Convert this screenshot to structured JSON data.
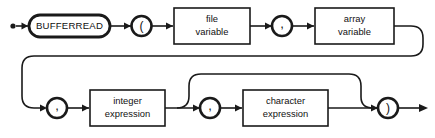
{
  "diagram": {
    "kind": "railroad-syntax-diagram",
    "statement": "BUFFERREAD",
    "start_marker": "start-dot",
    "end_marker": "arrow",
    "nodes": {
      "keyword": {
        "label": "BUFFERREAD",
        "shape": "stadium"
      },
      "open_paren": {
        "label": "(",
        "shape": "circle"
      },
      "file_variable": {
        "line1": "file",
        "line2": "variable",
        "shape": "rect"
      },
      "comma1": {
        "label": ",",
        "shape": "circle"
      },
      "array_variable": {
        "line1": "array",
        "line2": "variable",
        "shape": "rect"
      },
      "comma2": {
        "label": ",",
        "shape": "circle"
      },
      "integer_expression": {
        "line1": "integer",
        "line2": "expression",
        "shape": "rect"
      },
      "comma3": {
        "label": ",",
        "shape": "circle"
      },
      "character_expression": {
        "line1": "character",
        "line2": "expression",
        "shape": "rect"
      },
      "close_paren": {
        "label": ")",
        "shape": "circle"
      }
    },
    "paths": {
      "main": "start -> BUFFERREAD -> ( -> file variable -> , -> array variable -> wrap -> , -> integer expression -> , -> character expression -> ) -> end",
      "optional_bypass": "after integer expression skip , and character expression directly to )"
    },
    "colors": {
      "stroke": "#1a1a1a",
      "fill": "#ffffff",
      "background": "#ffffff",
      "text": "#111111"
    }
  }
}
